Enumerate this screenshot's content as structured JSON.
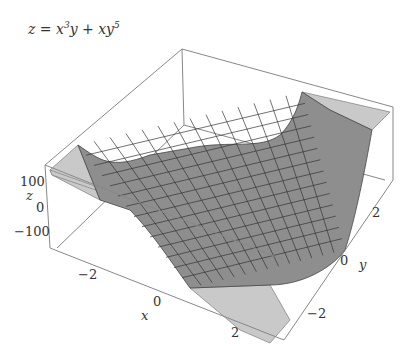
{
  "chart_data": {
    "type": "surface3d",
    "function": "z = x^3*y + x*y^5",
    "xlabel": "x",
    "ylabel": "y",
    "zlabel": "z",
    "xlim": [
      -3,
      3
    ],
    "ylim": [
      -3,
      3
    ],
    "zlim": [
      -150,
      150
    ],
    "x_ticks": [
      "-2",
      "0",
      "2"
    ],
    "y_ticks": [
      "-2",
      "0",
      "2"
    ],
    "z_ticks": [
      "100",
      "0",
      "-100"
    ],
    "mesh_lines": 15,
    "surface_color": "#8a8a8a",
    "clipped_color": "#c8c8c8",
    "grid": false,
    "box": true
  },
  "labels": {
    "title_z": "z",
    "title_eq": " = x",
    "title_sup1": "3",
    "title_mid": "y + xy",
    "title_sup2": "5",
    "x_axis": "x",
    "y_axis": "y",
    "z_axis": "z",
    "xt0": "−2",
    "xt1": "0",
    "xt2": "2",
    "yt0": "−2",
    "yt1": "0",
    "yt2": "2",
    "zt0": "100",
    "zt1": "0",
    "zt2": "−100"
  }
}
